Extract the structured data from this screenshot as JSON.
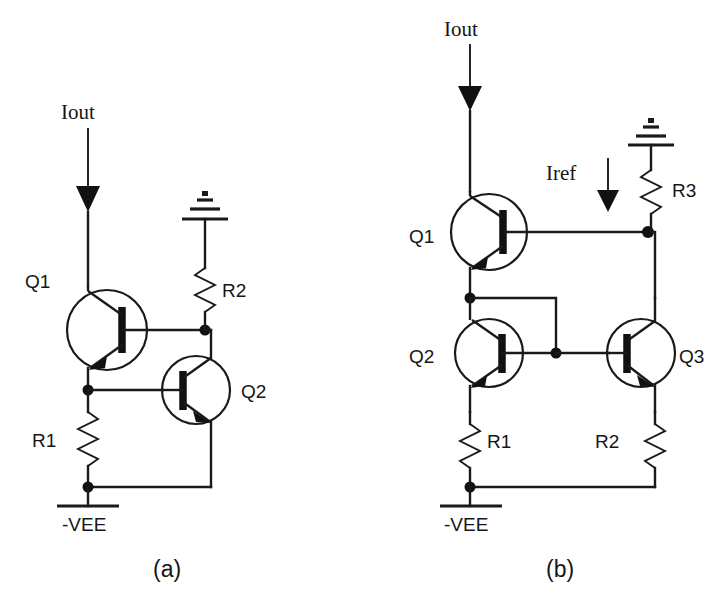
{
  "figure": {
    "type": "circuit-schematic",
    "background_color": "#ffffff",
    "line_color": "#1a1a1a"
  },
  "circuit_a": {
    "caption": "(a)",
    "labels": {
      "iout": "Iout",
      "q1": "Q1",
      "q2": "Q2",
      "r1": "R1",
      "r2": "R2",
      "vee": "-VEE"
    },
    "components": [
      {
        "name": "Q1",
        "type": "npn-transistor",
        "orientation": "normal"
      },
      {
        "name": "Q2",
        "type": "npn-transistor",
        "orientation": "mirrored"
      },
      {
        "name": "R1",
        "type": "resistor",
        "orientation": "vertical"
      },
      {
        "name": "R2",
        "type": "resistor",
        "orientation": "vertical"
      }
    ],
    "terminals": [
      {
        "name": "Iout",
        "type": "current-arrow",
        "direction": "down"
      },
      {
        "name": "ground",
        "type": "ground-symbol-inverted"
      },
      {
        "name": "-VEE",
        "type": "supply-rail"
      }
    ]
  },
  "circuit_b": {
    "caption": "(b)",
    "labels": {
      "iout": "Iout",
      "iref": "Iref",
      "q1": "Q1",
      "q2": "Q2",
      "q3": "Q3",
      "r1": "R1",
      "r2": "R2",
      "r3": "R3",
      "vee": "-VEE"
    },
    "components": [
      {
        "name": "Q1",
        "type": "npn-transistor",
        "orientation": "normal"
      },
      {
        "name": "Q2",
        "type": "npn-transistor",
        "orientation": "normal"
      },
      {
        "name": "Q3",
        "type": "npn-transistor",
        "orientation": "mirrored"
      },
      {
        "name": "R1",
        "type": "resistor",
        "orientation": "vertical"
      },
      {
        "name": "R2",
        "type": "resistor",
        "orientation": "vertical"
      },
      {
        "name": "R3",
        "type": "resistor",
        "orientation": "vertical"
      }
    ],
    "terminals": [
      {
        "name": "Iout",
        "type": "current-arrow",
        "direction": "down"
      },
      {
        "name": "Iref",
        "type": "current-arrow",
        "direction": "down"
      },
      {
        "name": "ground",
        "type": "ground-symbol-inverted"
      },
      {
        "name": "-VEE",
        "type": "supply-rail"
      }
    ]
  }
}
